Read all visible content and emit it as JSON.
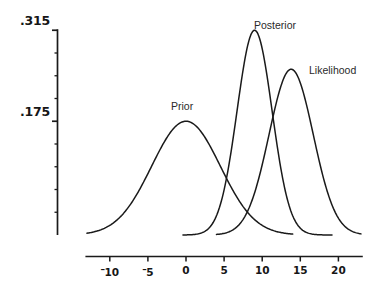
{
  "chart_data": {
    "type": "line",
    "title": "",
    "xlabel": "",
    "ylabel": "",
    "xlim": [
      -14,
      24
    ],
    "ylim": [
      0,
      0.33
    ],
    "grid": false,
    "legend_position": "inline-annotations",
    "x_ticks": [
      {
        "value": -10,
        "label": "10",
        "negative": true
      },
      {
        "value": -5,
        "label": "5",
        "negative": true
      },
      {
        "value": 0,
        "label": "0",
        "negative": false
      },
      {
        "value": 5,
        "label": "5",
        "negative": false
      },
      {
        "value": 10,
        "label": "10",
        "negative": false
      },
      {
        "value": 15,
        "label": "15",
        "negative": false
      },
      {
        "value": 20,
        "label": "20",
        "negative": false
      }
    ],
    "y_ticks_labeled": [
      {
        "value": 0.315,
        "label": ".315"
      },
      {
        "value": 0.175,
        "label": ".175"
      }
    ],
    "y_minor_tick_values": [
      0.28,
      0.245,
      0.21,
      0.14,
      0.105,
      0.07,
      0.035,
      0.0
    ],
    "series": [
      {
        "name": "Prior",
        "label": "Prior",
        "distribution": "normal",
        "mean": 0,
        "sigma": 4.5,
        "peak": 0.175,
        "color": "#1a1a1a"
      },
      {
        "name": "Posterior",
        "label": "Posterior",
        "distribution": "normal",
        "mean": 9,
        "sigma": 2.3,
        "peak": 0.315,
        "color": "#1a1a1a"
      },
      {
        "name": "Likelihood",
        "label": "Likelihood",
        "distribution": "normal",
        "mean": 13.8,
        "sigma": 2.9,
        "peak": 0.255,
        "color": "#1a1a1a"
      }
    ]
  },
  "axes": {
    "y_high_label": ".315",
    "y_low_label": ".175",
    "axis_color": "#1a1a1a"
  },
  "annotations": {
    "prior": "Prior",
    "posterior": "Posterior",
    "likelihood": "Likelihood"
  }
}
